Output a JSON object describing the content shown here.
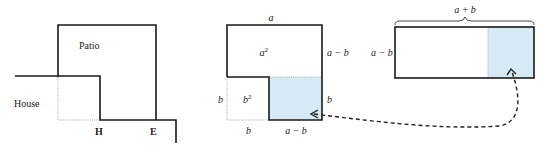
{
  "colors": {
    "line": "#1a1a1a",
    "fill_highlight": "#d6eaf5",
    "background": "#ffffff"
  },
  "left_diagram": {
    "labels": {
      "patio": "Patio",
      "house": "House",
      "h": "H",
      "e": "E"
    }
  },
  "middle_diagram": {
    "labels": {
      "top": "a",
      "area_big": "a",
      "area_big_exp": "2",
      "right_upper": "a − b",
      "left_side": "b",
      "area_small": "b",
      "area_small_exp": "2",
      "right_lower": "b",
      "bottom_left": "b",
      "bottom_right": "a − b"
    }
  },
  "right_diagram": {
    "labels": {
      "top": "a + b",
      "left": "a − b"
    }
  },
  "arrow": {
    "style": "dashed",
    "description": "moves shaded rectangle from square to long rectangle"
  }
}
